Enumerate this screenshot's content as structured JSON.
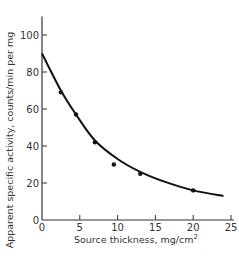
{
  "chart_data": {
    "type": "line",
    "title": "",
    "xlabel": "Source thickness, mg/cm",
    "xlabel_superscript": "2",
    "ylabel": "Apparent specific activity, counts/min per mg",
    "xlim": [
      0,
      25
    ],
    "ylim": [
      0,
      110
    ],
    "x_ticks": [
      0,
      5,
      10,
      15,
      20,
      25
    ],
    "y_ticks": [
      0,
      20,
      40,
      60,
      80,
      100
    ],
    "grid": false,
    "legend": null,
    "series": [
      {
        "name": "measured points",
        "kind": "scatter",
        "x": [
          2.5,
          4.5,
          7,
          9.5,
          13,
          20
        ],
        "y": [
          69,
          57,
          42,
          30,
          25,
          16
        ]
      },
      {
        "name": "fitted curve",
        "kind": "line",
        "x": [
          0,
          2.5,
          4.5,
          7,
          10,
          13,
          16,
          20,
          24
        ],
        "y": [
          90,
          70,
          57,
          43,
          33,
          26,
          21,
          16,
          13
        ]
      }
    ],
    "colors": {
      "line": "#111111",
      "axis": "#333333",
      "text": "#333333"
    }
  }
}
